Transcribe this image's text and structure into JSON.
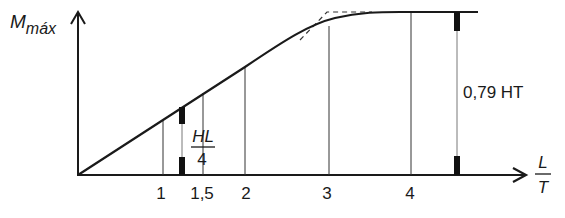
{
  "diagram": {
    "y_axis_label_main": "M",
    "y_axis_label_sub": "máx",
    "x_axis_label_numerator": "L",
    "x_axis_label_denominator": "T",
    "x_ticks": [
      "1",
      "1,5",
      "2",
      "3",
      "4"
    ],
    "left_dimension": {
      "numerator": "HL",
      "denominator": "4"
    },
    "right_dimension": "0,79 HT",
    "curve_description": "Mmáx grows ~linearly with L/T then saturates at plateau 0,79 HT near L/T≈3.7; dashed line shows linear extension to plateau",
    "colors": {
      "line": "#1a1a1a",
      "background": "#ffffff"
    }
  }
}
